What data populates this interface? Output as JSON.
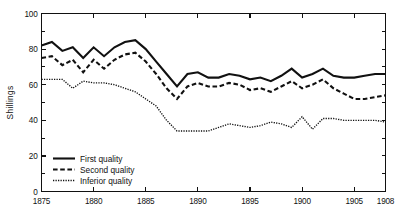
{
  "chart_data": {
    "type": "line",
    "title": "",
    "subtitle": "",
    "xlabel": "",
    "ylabel": "Shillings",
    "xlim": [
      1875,
      1908
    ],
    "ylim": [
      0,
      100
    ],
    "grid": false,
    "legend_position": "bottom-left",
    "x_tick_labels": [
      "1875",
      "1880",
      "1885",
      "1890",
      "1895",
      "1900",
      "1905",
      "1908"
    ],
    "x_tick_values": [
      1875,
      1880,
      1885,
      1890,
      1895,
      1900,
      1905,
      1908
    ],
    "y_tick_labels": [
      "0",
      "20",
      "40",
      "60",
      "80",
      "100"
    ],
    "y_tick_values": [
      0,
      20,
      40,
      60,
      80,
      100
    ],
    "y_minor_ticks": [
      10,
      30,
      50,
      70,
      90
    ],
    "x": [
      1875,
      1876,
      1877,
      1878,
      1879,
      1880,
      1881,
      1882,
      1883,
      1884,
      1885,
      1886,
      1887,
      1888,
      1889,
      1890,
      1891,
      1892,
      1893,
      1894,
      1895,
      1896,
      1897,
      1898,
      1899,
      1900,
      1901,
      1902,
      1903,
      1904,
      1905,
      1906,
      1907,
      1908
    ],
    "series": [
      {
        "name": "First quality",
        "style": "solid",
        "values": [
          82,
          84,
          79,
          81,
          75,
          81,
          76,
          81,
          84,
          85,
          80,
          73,
          66,
          59,
          66,
          67,
          64,
          64,
          66,
          65,
          63,
          64,
          62,
          65,
          69,
          64,
          66,
          69,
          65,
          64,
          64,
          65,
          66,
          66
        ]
      },
      {
        "name": "Second quality",
        "style": "dashed",
        "values": [
          75,
          76,
          71,
          74,
          67,
          74,
          69,
          74,
          77,
          78,
          73,
          66,
          58,
          52,
          59,
          61,
          59,
          59,
          61,
          60,
          57,
          58,
          56,
          59,
          62,
          58,
          60,
          63,
          58,
          55,
          52,
          52,
          53,
          54
        ]
      },
      {
        "name": "Inferior quality",
        "style": "dotted",
        "values": [
          63,
          63,
          63,
          58,
          62,
          61,
          61,
          60,
          58,
          56,
          52,
          48,
          40,
          34,
          34,
          34,
          34,
          36,
          38,
          37,
          36,
          37,
          39,
          38,
          36,
          42,
          35,
          41,
          41,
          40,
          40,
          40,
          40,
          39
        ]
      }
    ],
    "legend": [
      {
        "label": "First quality",
        "style": "solid"
      },
      {
        "label": "Second quality",
        "style": "dashed"
      },
      {
        "label": "Inferior quality",
        "style": "dotted"
      }
    ],
    "colors": {
      "line": "#111111",
      "axis": "#111111",
      "background": "#ffffff"
    }
  }
}
